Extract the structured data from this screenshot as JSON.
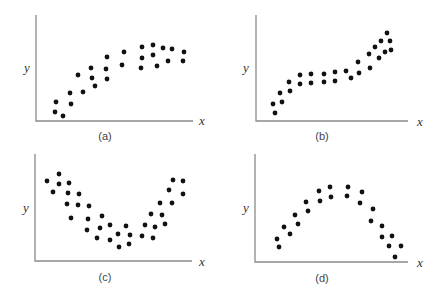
{
  "figure": {
    "panels": [
      {
        "id": "a",
        "label": "(a)",
        "xlabel": "x",
        "ylabel": "y",
        "shape": "increasing, concave (leveling off)",
        "axis": {
          "x0": 36,
          "y0": 121,
          "ytop": 15,
          "xend": 193
        },
        "xlabel_pos": [
          199,
          125
        ],
        "ylabel_pos": [
          24,
          72
        ],
        "label_pos": [
          105,
          140
        ],
        "points": [
          [
            56,
            102
          ],
          [
            55,
            112
          ],
          [
            63,
            116
          ],
          [
            70,
            93
          ],
          [
            71,
            104
          ],
          [
            78,
            75
          ],
          [
            83,
            92
          ],
          [
            91,
            68
          ],
          [
            92,
            78
          ],
          [
            95,
            86
          ],
          [
            107,
            57
          ],
          [
            106,
            69
          ],
          [
            107,
            79
          ],
          [
            124,
            52
          ],
          [
            122,
            65
          ],
          [
            142,
            47
          ],
          [
            142,
            58
          ],
          [
            141,
            68
          ],
          [
            153,
            45
          ],
          [
            153,
            55
          ],
          [
            157,
            66
          ],
          [
            163,
            48
          ],
          [
            168,
            61
          ],
          [
            172,
            49
          ],
          [
            184,
            52
          ],
          [
            183,
            61
          ]
        ]
      },
      {
        "id": "b",
        "label": "(b)",
        "xlabel": "x",
        "ylabel": "y",
        "shape": "cubic-like (rise, plateau, rise)",
        "axis": {
          "x0": 256,
          "y0": 121,
          "ytop": 15,
          "xend": 408
        },
        "xlabel_pos": [
          417,
          126
        ],
        "ylabel_pos": [
          243,
          72
        ],
        "label_pos": [
          322,
          140
        ],
        "points": [
          [
            273,
            104
          ],
          [
            275,
            113
          ],
          [
            280,
            93
          ],
          [
            282,
            102
          ],
          [
            289,
            82
          ],
          [
            290,
            91
          ],
          [
            300,
            75
          ],
          [
            300,
            84
          ],
          [
            311,
            74
          ],
          [
            311,
            83
          ],
          [
            324,
            74
          ],
          [
            324,
            82
          ],
          [
            335,
            72
          ],
          [
            335,
            81
          ],
          [
            346,
            71
          ],
          [
            351,
            78
          ],
          [
            358,
            62
          ],
          [
            359,
            73
          ],
          [
            369,
            54
          ],
          [
            370,
            68
          ],
          [
            375,
            47
          ],
          [
            379,
            58
          ],
          [
            381,
            41
          ],
          [
            385,
            52
          ],
          [
            387,
            33
          ],
          [
            390,
            41
          ],
          [
            391,
            50
          ]
        ]
      },
      {
        "id": "c",
        "label": "(c)",
        "xlabel": "x",
        "ylabel": "y",
        "shape": "U-shaped (convex)",
        "axis": {
          "x0": 35,
          "y0": 261,
          "ytop": 154,
          "xend": 192
        },
        "xlabel_pos": [
          199,
          266
        ],
        "ylabel_pos": [
          23,
          212
        ],
        "label_pos": [
          105,
          281
        ],
        "points": [
          [
            47,
            181
          ],
          [
            53,
            192
          ],
          [
            59,
            174
          ],
          [
            59,
            184
          ],
          [
            69,
            183
          ],
          [
            68,
            193
          ],
          [
            67,
            204
          ],
          [
            71,
            218
          ],
          [
            79,
            194
          ],
          [
            78,
            205
          ],
          [
            89,
            206
          ],
          [
            88,
            219
          ],
          [
            87,
            230
          ],
          [
            102,
            216
          ],
          [
            100,
            228
          ],
          [
            97,
            238
          ],
          [
            110,
            225
          ],
          [
            110,
            240
          ],
          [
            118,
            234
          ],
          [
            119,
            247
          ],
          [
            126,
            226
          ],
          [
            130,
            235
          ],
          [
            129,
            244
          ],
          [
            142,
            236
          ],
          [
            145,
            225
          ],
          [
            153,
            238
          ],
          [
            155,
            227
          ],
          [
            151,
            214
          ],
          [
            162,
            215
          ],
          [
            165,
            224
          ],
          [
            160,
            203
          ],
          [
            172,
            203
          ],
          [
            169,
            190
          ],
          [
            173,
            180
          ],
          [
            183,
            194
          ],
          [
            183,
            181
          ]
        ]
      },
      {
        "id": "d",
        "label": "(d)",
        "xlabel": "x",
        "ylabel": "y",
        "shape": "inverted U (concave)",
        "axis": {
          "x0": 255,
          "y0": 262,
          "ytop": 154,
          "xend": 408
        },
        "xlabel_pos": [
          417,
          267
        ],
        "ylabel_pos": [
          243,
          212
        ],
        "label_pos": [
          322,
          282
        ],
        "points": [
          [
            277,
            239
          ],
          [
            279,
            247
          ],
          [
            284,
            227
          ],
          [
            290,
            234
          ],
          [
            295,
            215
          ],
          [
            298,
            224
          ],
          [
            306,
            202
          ],
          [
            308,
            211
          ],
          [
            319,
            191
          ],
          [
            320,
            201
          ],
          [
            330,
            187
          ],
          [
            331,
            197
          ],
          [
            348,
            187
          ],
          [
            347,
            196
          ],
          [
            362,
            192
          ],
          [
            360,
            203
          ],
          [
            373,
            209
          ],
          [
            371,
            221
          ],
          [
            382,
            226
          ],
          [
            382,
            237
          ],
          [
            392,
            236
          ],
          [
            389,
            246
          ],
          [
            401,
            246
          ],
          [
            395,
            257
          ]
        ]
      }
    ],
    "colors": {
      "dot": "#111111",
      "axis": "#8a8a8a",
      "text": "#333333"
    }
  }
}
